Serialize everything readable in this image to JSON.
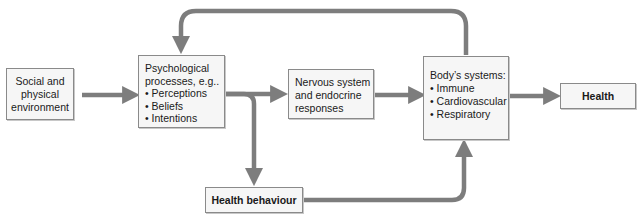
{
  "diagram": {
    "nodes": {
      "social": {
        "lines": [
          "Social and",
          "physical",
          "environment"
        ]
      },
      "psych": {
        "heading": [
          "Psychological",
          "processes, e.g.."
        ],
        "items": [
          "Perceptions",
          "Beliefs",
          "Intentions"
        ]
      },
      "nervous": {
        "lines": [
          "Nervous system",
          "and endocrine",
          "responses"
        ]
      },
      "body": {
        "heading": [
          "Body’s systems:"
        ],
        "items": [
          "Immune",
          "Cardiovascular",
          "Respiratory"
        ]
      },
      "health": {
        "label": "Health"
      },
      "behaviour": {
        "label": "Health behaviour"
      }
    },
    "edges": [
      {
        "from": "Social and physical environment",
        "to": "Psychological processes"
      },
      {
        "from": "Psychological processes",
        "to": "Nervous system and endocrine responses"
      },
      {
        "from": "Psychological processes",
        "to": "Health behaviour"
      },
      {
        "from": "Nervous system and endocrine responses",
        "to": "Body's systems"
      },
      {
        "from": "Health behaviour",
        "to": "Body's systems"
      },
      {
        "from": "Body's systems",
        "to": "Health"
      },
      {
        "from": "Body's systems",
        "to": "Psychological processes",
        "type": "feedback"
      }
    ],
    "colors": {
      "arrow": "#7d7d7d",
      "arrow_edge": "#5e5e5e",
      "box_fill": "#f6f6f6",
      "box_border": "#8a8a8a"
    }
  }
}
